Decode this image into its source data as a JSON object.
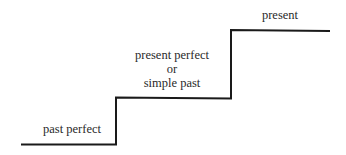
{
  "diagram": {
    "type": "staircase",
    "steps": [
      {
        "label_lines": [
          "past perfect"
        ]
      },
      {
        "label_lines": [
          "present perfect",
          "or",
          "simple past"
        ]
      },
      {
        "label_lines": [
          "present"
        ]
      }
    ],
    "line_color": "#1a1a1a"
  }
}
